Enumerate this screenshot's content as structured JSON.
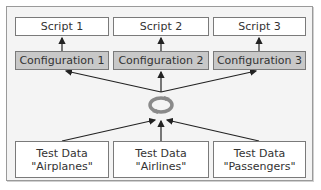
{
  "diagram": {
    "scripts": [
      {
        "label": "Script 1"
      },
      {
        "label": "Script 2"
      },
      {
        "label": "Script 3"
      }
    ],
    "configurations": [
      {
        "label": "Configuration 1"
      },
      {
        "label": "Configuration 2"
      },
      {
        "label": "Configuration 3"
      }
    ],
    "hub": {
      "icon": "cycle-icon"
    },
    "test_data": [
      {
        "line1": "Test Data",
        "line2": "\"Airplanes\""
      },
      {
        "line1": "Test Data",
        "line2": "\"Airlines\""
      },
      {
        "line1": "Test Data",
        "line2": "\"Passengers\""
      }
    ],
    "colors": {
      "config_fill": "#c8c8c8",
      "box_border": "#7a7a7a",
      "frame_bg": "#f4f4f4",
      "arrow": "#222222",
      "cycle_icon": "#8a8a8a"
    }
  }
}
